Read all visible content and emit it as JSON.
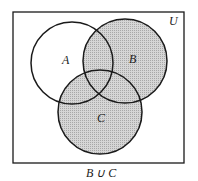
{
  "diagram": {
    "type": "venn",
    "universe_label": "U",
    "sets": [
      {
        "name": "A",
        "label": "A",
        "shaded": false
      },
      {
        "name": "B",
        "label": "B",
        "shaded": true
      },
      {
        "name": "C",
        "label": "C",
        "shaded": true
      }
    ],
    "caption": "B ∪ C",
    "colors": {
      "shade": "#c8c8c8",
      "stroke": "#1a1a1a",
      "background": "#ffffff"
    }
  }
}
